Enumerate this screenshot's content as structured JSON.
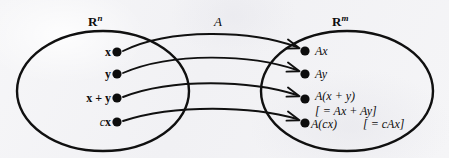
{
  "figure": {
    "background_color": "#f4f4f5",
    "ink_color": "#0d0d0d"
  },
  "domain_set": {
    "name_base": "R",
    "name_superscript": "n",
    "ellipse": {
      "cx": 103,
      "cy": 91,
      "rx": 86,
      "ry": 60
    }
  },
  "codomain_set": {
    "name_base": "R",
    "name_superscript": "m",
    "ellipse": {
      "cx": 347,
      "cy": 91,
      "rx": 86,
      "ry": 60
    }
  },
  "map": {
    "label": "A"
  },
  "elements": [
    {
      "source_label_italic": "",
      "source_label_bold": "x",
      "source_point": {
        "x": 117,
        "y": 52
      },
      "target_point": {
        "x": 305,
        "y": 51
      },
      "target_label": "Ax",
      "target_note": ""
    },
    {
      "source_label_italic": "",
      "source_label_bold": "y",
      "source_point": {
        "x": 117,
        "y": 74
      },
      "target_point": {
        "x": 305,
        "y": 74
      },
      "target_label": "Ay",
      "target_note": ""
    },
    {
      "source_label_italic": "",
      "source_label_bold": "x + y",
      "source_point": {
        "x": 117,
        "y": 98
      },
      "target_point": {
        "x": 305,
        "y": 99
      },
      "target_label": "A(x + y)",
      "target_note": "[ = Ax + Ay]"
    },
    {
      "source_label_italic": "c",
      "source_label_bold": "x",
      "source_point": {
        "x": 117,
        "y": 122
      },
      "target_point": {
        "x": 305,
        "y": 123
      },
      "target_label": "A(cx)",
      "target_note": "[ = cAx]"
    }
  ]
}
